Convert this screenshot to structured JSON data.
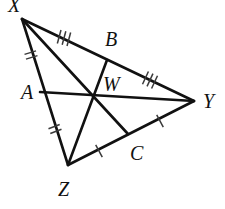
{
  "figure": {
    "background_color": "#ffffff",
    "stroke_color": "#111111",
    "tick_color": "#3a3a3a",
    "width": 225,
    "height": 209
  },
  "points": {
    "X": {
      "label": "X",
      "x": 22,
      "y": 19,
      "label_x": 8,
      "label_y": 12
    },
    "Y": {
      "label": "Y",
      "x": 194,
      "y": 101,
      "label_x": 203,
      "label_y": 108
    },
    "Z": {
      "label": "Z",
      "x": 68,
      "y": 165,
      "label_x": 58,
      "label_y": 196
    },
    "A": {
      "label": "A",
      "x": 40,
      "y": 92,
      "label_x": 21,
      "label_y": 99
    },
    "B": {
      "label": "B",
      "x": 107,
      "y": 60,
      "label_x": 105,
      "label_y": 46
    },
    "C": {
      "label": "C",
      "x": 128,
      "y": 134,
      "label_x": 130,
      "label_y": 160
    },
    "W": {
      "label": "W",
      "x": 94,
      "y": 97,
      "label_x": 103,
      "label_y": 91
    }
  },
  "edges": [
    {
      "name": "side-XY",
      "from": "X",
      "to": "Y"
    },
    {
      "name": "side-YZ",
      "from": "Y",
      "to": "Z"
    },
    {
      "name": "side-ZX",
      "from": "Z",
      "to": "X"
    }
  ],
  "cevians": [
    {
      "name": "median-XC",
      "from": "X",
      "to": "C"
    },
    {
      "name": "median-YA",
      "from": "A",
      "to": "Y"
    },
    {
      "name": "median-ZB",
      "from": "Z",
      "to": "B"
    }
  ],
  "tick_marks": [
    {
      "name": "tick-XA",
      "segment": "XA",
      "count": 2,
      "x": 31,
      "y": 55,
      "angle": 73
    },
    {
      "name": "tick-AZ",
      "segment": "AZ",
      "count": 2,
      "x": 55,
      "y": 129,
      "angle": 69
    },
    {
      "name": "tick-XB",
      "segment": "XB",
      "count": 3,
      "x": 64,
      "y": 38,
      "angle": 15
    },
    {
      "name": "tick-BY",
      "segment": "BY",
      "count": 3,
      "x": 150,
      "y": 80,
      "angle": 25
    },
    {
      "name": "tick-ZC",
      "segment": "ZC",
      "count": 1,
      "x": 99,
      "y": 151,
      "angle": 152
    },
    {
      "name": "tick-CY",
      "segment": "CY",
      "count": 1,
      "x": 160,
      "y": 121,
      "angle": 152
    }
  ],
  "labels": {
    "X": "X",
    "Y": "Y",
    "Z": "Z",
    "A": "A",
    "B": "B",
    "C": "C",
    "W": "W"
  }
}
